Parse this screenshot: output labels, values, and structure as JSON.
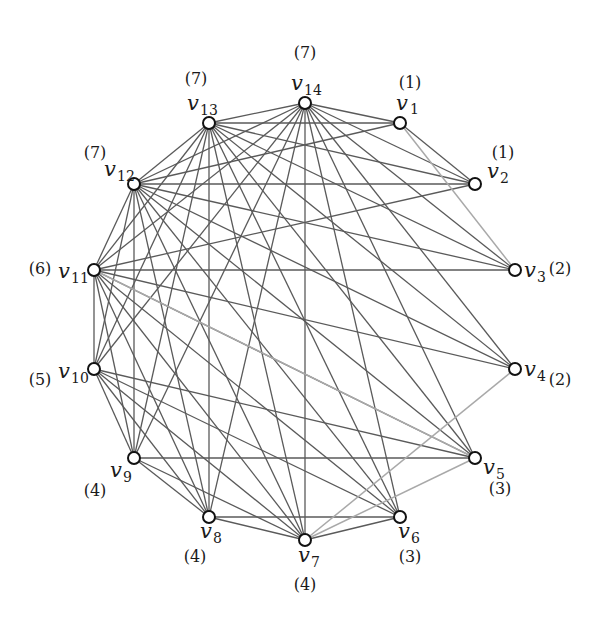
{
  "figure": {
    "type": "graph",
    "vertices": [
      {
        "id": "v1",
        "name": "v",
        "sub": "1",
        "weight": "(1)",
        "x": 400,
        "y": 123,
        "lx": 396,
        "ly": 110,
        "wx": 410,
        "wy": 88,
        "sx": 410,
        "sy": 114
      },
      {
        "id": "v2",
        "name": "v",
        "sub": "2",
        "weight": "(1)",
        "x": 475,
        "y": 184,
        "lx": 487,
        "ly": 178,
        "wx": 503,
        "wy": 158,
        "sx": 500,
        "sy": 183
      },
      {
        "id": "v3",
        "name": "v",
        "sub": "3",
        "weight": "(2)",
        "x": 515,
        "y": 270,
        "lx": 524,
        "ly": 277,
        "wx": 560,
        "wy": 274,
        "sx": 537,
        "sy": 282
      },
      {
        "id": "v4",
        "name": "v",
        "sub": "4",
        "weight": "(2)",
        "x": 515,
        "y": 369,
        "lx": 524,
        "ly": 376,
        "wx": 560,
        "wy": 385,
        "sx": 537,
        "sy": 381
      },
      {
        "id": "v5",
        "name": "v",
        "sub": "5",
        "weight": "(3)",
        "x": 475,
        "y": 458,
        "lx": 483,
        "ly": 474,
        "wx": 500,
        "wy": 494,
        "sx": 496,
        "sy": 479
      },
      {
        "id": "v6",
        "name": "v",
        "sub": "6",
        "weight": "(3)",
        "x": 400,
        "y": 517,
        "lx": 398,
        "ly": 538,
        "wx": 410,
        "wy": 562,
        "sx": 411,
        "sy": 543
      },
      {
        "id": "v7",
        "name": "v",
        "sub": "7",
        "weight": "(4)",
        "x": 305,
        "y": 540,
        "lx": 298,
        "ly": 562,
        "wx": 305,
        "wy": 590,
        "sx": 311,
        "sy": 567
      },
      {
        "id": "v8",
        "name": "v",
        "sub": "8",
        "weight": "(4)",
        "x": 209,
        "y": 517,
        "lx": 200,
        "ly": 538,
        "wx": 195,
        "wy": 562,
        "sx": 213,
        "sy": 543
      },
      {
        "id": "v9",
        "name": "v",
        "sub": "9",
        "weight": "(4)",
        "x": 134,
        "y": 458,
        "lx": 110,
        "ly": 477,
        "wx": 95,
        "wy": 496,
        "sx": 123,
        "sy": 482
      },
      {
        "id": "v10",
        "name": "v",
        "sub": "10",
        "weight": "(5)",
        "x": 94,
        "y": 369,
        "lx": 58,
        "ly": 378,
        "wx": 40,
        "wy": 385,
        "sx": 71,
        "sy": 383
      },
      {
        "id": "v11",
        "name": "v",
        "sub": "11",
        "weight": "(6)",
        "x": 94,
        "y": 270,
        "lx": 58,
        "ly": 278,
        "wx": 40,
        "wy": 274,
        "sx": 71,
        "sy": 283
      },
      {
        "id": "v12",
        "name": "v",
        "sub": "12",
        "weight": "(7)",
        "x": 134,
        "y": 184,
        "lx": 104,
        "ly": 176,
        "wx": 95,
        "wy": 158,
        "sx": 117,
        "sy": 181
      },
      {
        "id": "v13",
        "name": "v",
        "sub": "13",
        "weight": "(7)",
        "x": 209,
        "y": 123,
        "lx": 187,
        "ly": 110,
        "wx": 196,
        "wy": 84,
        "sx": 200,
        "sy": 115
      },
      {
        "id": "v14",
        "name": "v",
        "sub": "14",
        "weight": "(7)",
        "x": 305,
        "y": 103,
        "lx": 291,
        "ly": 90,
        "wx": 305,
        "wy": 58,
        "sx": 304,
        "sy": 95
      }
    ],
    "edges": [
      [
        "v12",
        "v13"
      ],
      [
        "v12",
        "v14"
      ],
      [
        "v13",
        "v14"
      ],
      [
        "v1",
        "v12"
      ],
      [
        "v1",
        "v13"
      ],
      [
        "v1",
        "v14"
      ],
      [
        "v2",
        "v12"
      ],
      [
        "v2",
        "v13"
      ],
      [
        "v2",
        "v14"
      ],
      [
        "v3",
        "v11"
      ],
      [
        "v3",
        "v12"
      ],
      [
        "v3",
        "v13"
      ],
      [
        "v3",
        "v14"
      ],
      [
        "v4",
        "v11"
      ],
      [
        "v4",
        "v12"
      ],
      [
        "v4",
        "v13"
      ],
      [
        "v4",
        "v14"
      ],
      [
        "v5",
        "v10"
      ],
      [
        "v5",
        "v11"
      ],
      [
        "v5",
        "v12"
      ],
      [
        "v5",
        "v13"
      ],
      [
        "v5",
        "v14"
      ],
      [
        "v6",
        "v10"
      ],
      [
        "v6",
        "v11"
      ],
      [
        "v6",
        "v12"
      ],
      [
        "v6",
        "v13"
      ],
      [
        "v6",
        "v14"
      ],
      [
        "v7",
        "v8"
      ],
      [
        "v7",
        "v9"
      ],
      [
        "v7",
        "v10"
      ],
      [
        "v7",
        "v11"
      ],
      [
        "v7",
        "v12"
      ],
      [
        "v7",
        "v13"
      ],
      [
        "v7",
        "v14"
      ],
      [
        "v8",
        "v9"
      ],
      [
        "v8",
        "v10"
      ],
      [
        "v8",
        "v11"
      ],
      [
        "v8",
        "v12"
      ],
      [
        "v8",
        "v13"
      ],
      [
        "v8",
        "v14"
      ],
      [
        "v9",
        "v10"
      ],
      [
        "v9",
        "v11"
      ],
      [
        "v9",
        "v12"
      ],
      [
        "v9",
        "v13"
      ],
      [
        "v9",
        "v14"
      ],
      [
        "v10",
        "v11"
      ],
      [
        "v10",
        "v12"
      ],
      [
        "v10",
        "v13"
      ],
      [
        "v10",
        "v14"
      ],
      [
        "v11",
        "v12"
      ],
      [
        "v11",
        "v13"
      ],
      [
        "v11",
        "v14"
      ],
      [
        "v6",
        "v7"
      ],
      [
        "v6",
        "v8"
      ],
      [
        "v5",
        "v9"
      ],
      [
        "v2",
        "v11"
      ],
      [
        "v1",
        "v2"
      ]
    ],
    "highlighted_edges": [
      [
        "v1",
        "v3"
      ],
      [
        "v4",
        "v7"
      ],
      [
        "v11",
        "v5"
      ],
      [
        "v7",
        "v5"
      ]
    ]
  },
  "background_text_lines": [
    {
      "text": "",
      "x": 0,
      "y": 0
    }
  ]
}
